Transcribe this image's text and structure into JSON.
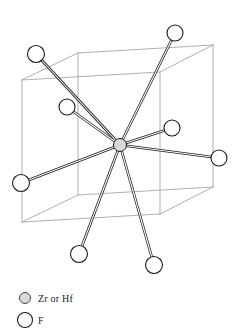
{
  "figure": {
    "background_color": "#ffffff",
    "line_color": "#1a1a1a",
    "cell_edge_color": "#9a9a9a",
    "metal_fill_color": "#d8d8d8",
    "fluorine_fill_color": "#ffffff"
  },
  "unit_cell": {
    "label": "cubic unit cell wireframe",
    "front_face": [
      {
        "x": 22,
        "y": 80
      },
      {
        "x": 160,
        "y": 72
      },
      {
        "x": 160,
        "y": 214
      },
      {
        "x": 22,
        "y": 222
      }
    ],
    "back_face": [
      {
        "x": 78,
        "y": 53
      },
      {
        "x": 213,
        "y": 45
      },
      {
        "x": 213,
        "y": 187
      },
      {
        "x": 78,
        "y": 195
      }
    ]
  },
  "central_atom": {
    "species": "Zr or Hf",
    "x": 120,
    "y": 145,
    "radius": 6.5
  },
  "ligand_atoms": [
    {
      "id": "F1",
      "species": "F",
      "x": 175,
      "y": 33,
      "radius": 8.0,
      "position": "top-right"
    },
    {
      "id": "F2",
      "species": "F",
      "x": 36,
      "y": 54,
      "radius": 8.5,
      "position": "top-left"
    },
    {
      "id": "F3",
      "species": "F",
      "x": 67,
      "y": 107,
      "radius": 8.0,
      "position": "inner-upper-left"
    },
    {
      "id": "F4",
      "species": "F",
      "x": 172,
      "y": 128,
      "radius": 8.0,
      "position": "right-upper"
    },
    {
      "id": "F5",
      "species": "F",
      "x": 219,
      "y": 158,
      "radius": 8.0,
      "position": "far-right"
    },
    {
      "id": "F6",
      "species": "F",
      "x": 21,
      "y": 183,
      "radius": 8.5,
      "position": "far-left"
    },
    {
      "id": "F7",
      "species": "F",
      "x": 79,
      "y": 254,
      "radius": 8.5,
      "position": "bottom-left"
    },
    {
      "id": "F8",
      "species": "F",
      "x": 154,
      "y": 265,
      "radius": 8.5,
      "position": "bottom-right"
    }
  ],
  "bonds": [
    {
      "from": "center",
      "to": "F1",
      "style": "double-line"
    },
    {
      "from": "center",
      "to": "F2",
      "style": "double-line"
    },
    {
      "from": "center",
      "to": "F3",
      "style": "double-line"
    },
    {
      "from": "center",
      "to": "F4",
      "style": "double-line"
    },
    {
      "from": "center",
      "to": "F5",
      "style": "double-line"
    },
    {
      "from": "center",
      "to": "F6",
      "style": "double-line"
    },
    {
      "from": "center",
      "to": "F7",
      "style": "double-line"
    },
    {
      "from": "center",
      "to": "F8",
      "style": "double-line"
    }
  ],
  "legend": {
    "items": [
      {
        "symbol": "metal-circle",
        "label": "Zr or Hf",
        "radius": 5.5,
        "fill": "#d8d8d8"
      },
      {
        "symbol": "fluorine-circle",
        "label": "F",
        "radius": 7.5,
        "fill": "#ffffff"
      }
    ]
  }
}
